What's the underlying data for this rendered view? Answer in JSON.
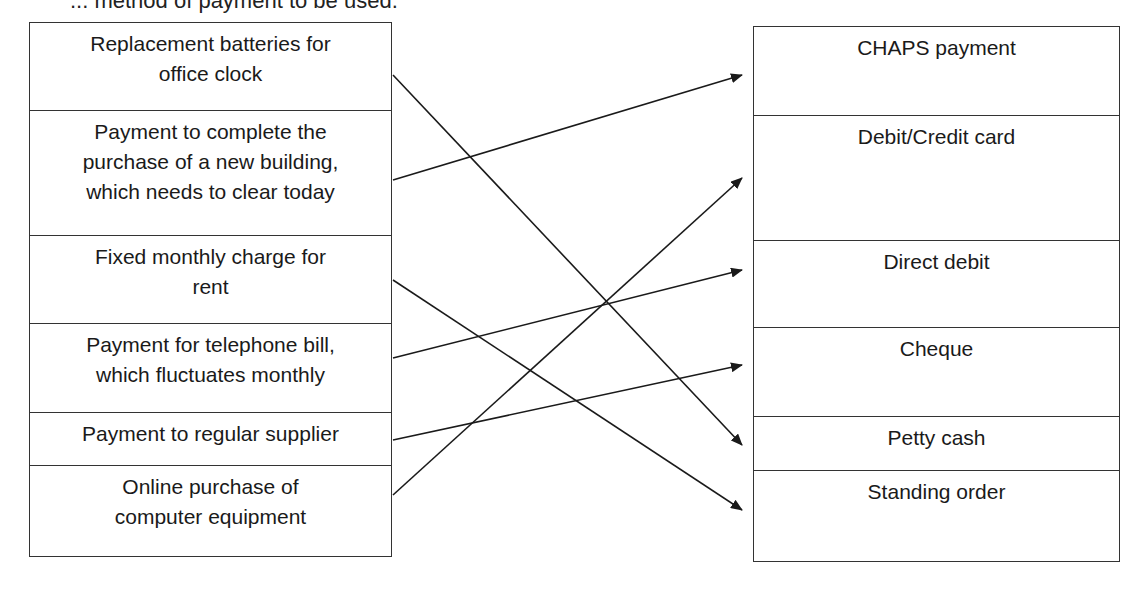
{
  "header": {
    "text": "... method of payment to be used."
  },
  "left_column": {
    "items": [
      {
        "label": "Replacement batteries for office clock",
        "lines": [
          "Replacement batteries for",
          "office clock"
        ],
        "height": 88
      },
      {
        "label": "Payment to complete the purchase of a new building, which needs to clear today",
        "lines": [
          "Payment to complete the",
          "purchase of a new building,",
          "which needs to clear today"
        ],
        "height": 125
      },
      {
        "label": "Fixed monthly charge for rent",
        "lines": [
          "Fixed monthly charge for",
          "rent"
        ],
        "height": 88
      },
      {
        "label": "Payment for telephone bill, which fluctuates monthly",
        "lines": [
          "Payment for telephone bill,",
          "which fluctuates monthly"
        ],
        "height": 89
      },
      {
        "label": "Payment to regular supplier",
        "lines": [
          "Payment to regular supplier"
        ],
        "height": 53
      },
      {
        "label": "Online purchase of computer equipment",
        "lines": [
          "Online purchase of",
          "computer equipment"
        ],
        "height": 90
      }
    ]
  },
  "right_column": {
    "items": [
      {
        "label": "CHAPS payment",
        "height": 89
      },
      {
        "label": "Debit/Credit card",
        "height": 125
      },
      {
        "label": "Direct debit",
        "height": 87
      },
      {
        "label": "Cheque",
        "height": 89
      },
      {
        "label": "Petty cash",
        "height": 54
      },
      {
        "label": "Standing order",
        "height": 90
      }
    ]
  },
  "connections": [
    {
      "from": "Replacement batteries for office clock",
      "to": "Petty cash",
      "x1": 393,
      "y1": 75,
      "x2": 742,
      "y2": 445
    },
    {
      "from": "Payment to complete the purchase of a new building, which needs to clear today",
      "to": "CHAPS payment",
      "x1": 393,
      "y1": 180,
      "x2": 742,
      "y2": 75
    },
    {
      "from": "Fixed monthly charge for rent",
      "to": "Standing order",
      "x1": 393,
      "y1": 280,
      "x2": 742,
      "y2": 510
    },
    {
      "from": "Payment for telephone bill, which fluctuates monthly",
      "to": "Direct debit",
      "x1": 393,
      "y1": 358,
      "x2": 742,
      "y2": 270
    },
    {
      "from": "Payment to regular supplier",
      "to": "Cheque",
      "x1": 393,
      "y1": 440,
      "x2": 742,
      "y2": 365
    },
    {
      "from": "Online purchase of computer equipment",
      "to": "Debit/Credit card",
      "x1": 393,
      "y1": 495,
      "x2": 742,
      "y2": 178
    }
  ],
  "colors": {
    "line": "#1a1a1a",
    "border": "#333333",
    "background": "#ffffff"
  }
}
